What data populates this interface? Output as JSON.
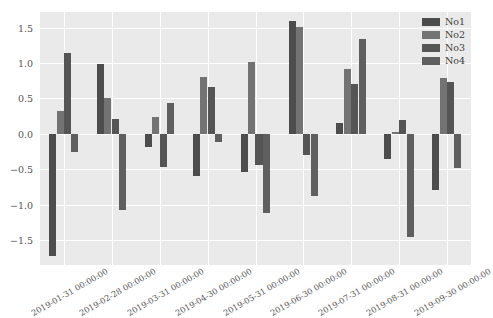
{
  "chart_data": {
    "type": "bar",
    "title": "",
    "xlabel": "",
    "ylabel": "",
    "ylim": [
      -1.85,
      1.72
    ],
    "yticks": [
      1.5,
      1.0,
      0.5,
      0.0,
      -0.5,
      -1.0,
      -1.5
    ],
    "ytick_labels": [
      "1.5",
      "1.0",
      "0.5",
      "0.0",
      "−0.5",
      "−1.0",
      "−1.5"
    ],
    "grid": true,
    "legend_position": "upper right",
    "background": "#eaeaea",
    "gridline_color": "#ffffff",
    "categories": [
      "2019-01-31 00:00:00",
      "2019-02-28 00:00:00",
      "2019-03-31 00:00:00",
      "2019-04-30 00:00:00",
      "2019-05-31 00:00:00",
      "2019-06-30 00:00:00",
      "2019-07-31 00:00:00",
      "2019-08-31 00:00:00",
      "2019-09-30 00:00:00"
    ],
    "series": [
      {
        "name": "No1",
        "color": "#4d4d4d",
        "values": [
          -1.73,
          0.98,
          -0.19,
          -0.6,
          -0.54,
          1.59,
          0.16,
          -0.35,
          -0.79
        ]
      },
      {
        "name": "No2",
        "color": "#737373",
        "values": [
          0.33,
          0.5,
          0.24,
          0.8,
          1.02,
          1.51,
          0.92,
          0.03,
          0.79
        ]
      },
      {
        "name": "No3",
        "color": "#555555",
        "values": [
          1.14,
          0.21,
          -0.47,
          0.66,
          -0.44,
          -0.3,
          0.71,
          0.2,
          0.73
        ]
      },
      {
        "name": "No4",
        "color": "#5f5f5f",
        "values": [
          -0.26,
          -1.08,
          0.43,
          -0.11,
          -1.12,
          -0.87,
          1.34,
          -1.46,
          -0.48
        ]
      }
    ]
  },
  "legend": {
    "entries": [
      "No1",
      "No2",
      "No3",
      "No4"
    ]
  }
}
